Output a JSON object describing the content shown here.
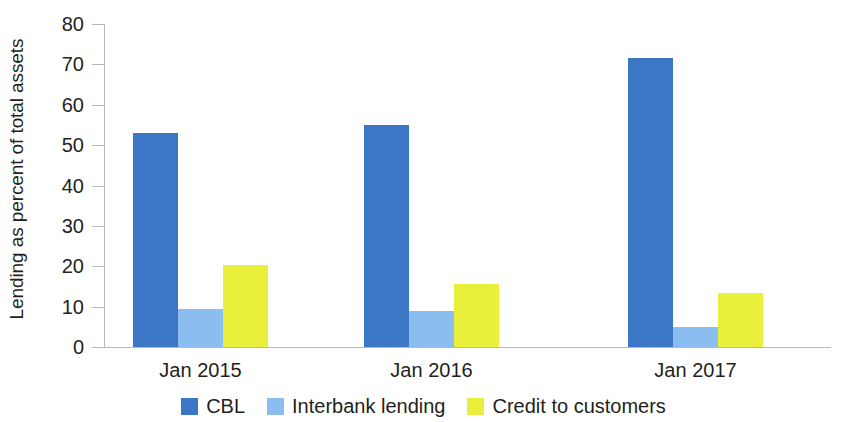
{
  "chart_data": {
    "type": "bar",
    "title": "",
    "xlabel": "",
    "ylabel": "Lending as percent of total assets",
    "categories": [
      "Jan 2015",
      "Jan 2016",
      "Jan 2017"
    ],
    "series": [
      {
        "name": "CBL",
        "color": "#3b77c4",
        "values": [
          53,
          55,
          71.5
        ]
      },
      {
        "name": "Interbank lending",
        "color": "#8cbdf0",
        "values": [
          9.5,
          9,
          5
        ]
      },
      {
        "name": "Credit to customers",
        "color": "#e9f03c",
        "values": [
          20.3,
          15.5,
          13.5
        ]
      }
    ],
    "ylim": [
      0,
      80
    ],
    "yticks": [
      0,
      10,
      20,
      30,
      40,
      50,
      60,
      70,
      80
    ],
    "ytick_labels": [
      "0",
      "10",
      "20",
      "30",
      "40",
      "50",
      "60",
      "70",
      "80"
    ],
    "grid": false,
    "legend_position": "bottom"
  },
  "axis": {
    "y_title": "Lending as percent of total assets"
  },
  "legend": {
    "items": [
      {
        "label": "CBL",
        "color": "#3b77c4"
      },
      {
        "label": "Interbank lending",
        "color": "#8cbdf0"
      },
      {
        "label": "Credit to customers",
        "color": "#e9f03c"
      }
    ]
  }
}
